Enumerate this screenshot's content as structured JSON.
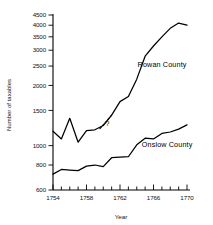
{
  "chart_data": {
    "type": "line",
    "title": "",
    "xlabel": "Year",
    "ylabel": "Number of taxables",
    "xlim": [
      1754,
      1770
    ],
    "ylim": [
      600,
      4500
    ],
    "yscale": "log",
    "grid": false,
    "legend_position": "inline-annotation",
    "x_ticks_major": [
      1754,
      1758,
      1762,
      1766,
      1770
    ],
    "x_ticks_minor": [
      1755,
      1756,
      1757,
      1759,
      1760,
      1761,
      1763,
      1764,
      1765,
      1767,
      1768,
      1769
    ],
    "y_ticks": [
      600,
      800,
      1000,
      1500,
      2000,
      2500,
      3000,
      3500,
      4000,
      4500
    ],
    "y_tick_labels": [
      "600",
      "800",
      "1000",
      "1500",
      "2000",
      "2500",
      "3000",
      "3500",
      "4000",
      "4500"
    ],
    "x_tick_labels": [
      "1754",
      "1758",
      "1762",
      "1766",
      "1770"
    ],
    "annotations": [
      {
        "text": "?",
        "x": 1760.5,
        "y": 1290,
        "note": "uncertain interpolated segment"
      }
    ],
    "series": [
      {
        "name": "Rowan County",
        "label": "Rowan County",
        "label_x": 1764.1,
        "label_y": 2480,
        "x": [
          1754,
          1755,
          1756,
          1757,
          1758,
          1759,
          1760,
          1761,
          1762,
          1763,
          1764,
          1765,
          1766,
          1767,
          1768,
          1769,
          1770
        ],
        "values": [
          1180,
          1080,
          1370,
          1040,
          1190,
          1200,
          1260,
          1420,
          1660,
          1760,
          2150,
          2800,
          3150,
          3500,
          3860,
          4100,
          4000
        ],
        "dashed_segment": {
          "x": [
            1759.6,
            1761.0
          ],
          "values": [
            1215,
            1420
          ]
        }
      },
      {
        "name": "Onslow County",
        "label": "Onslow County",
        "label_x": 1764.6,
        "label_y": 980,
        "x": [
          1754,
          1755,
          1756,
          1757,
          1758,
          1759,
          1760,
          1761,
          1762,
          1763,
          1764,
          1765,
          1766,
          1767,
          1768,
          1769,
          1770
        ],
        "values": [
          720,
          760,
          755,
          750,
          790,
          800,
          785,
          870,
          875,
          880,
          1010,
          1090,
          1080,
          1150,
          1170,
          1210,
          1270
        ]
      }
    ]
  },
  "axis": {
    "y_title": "Number of taxables",
    "x_title": "Year"
  }
}
